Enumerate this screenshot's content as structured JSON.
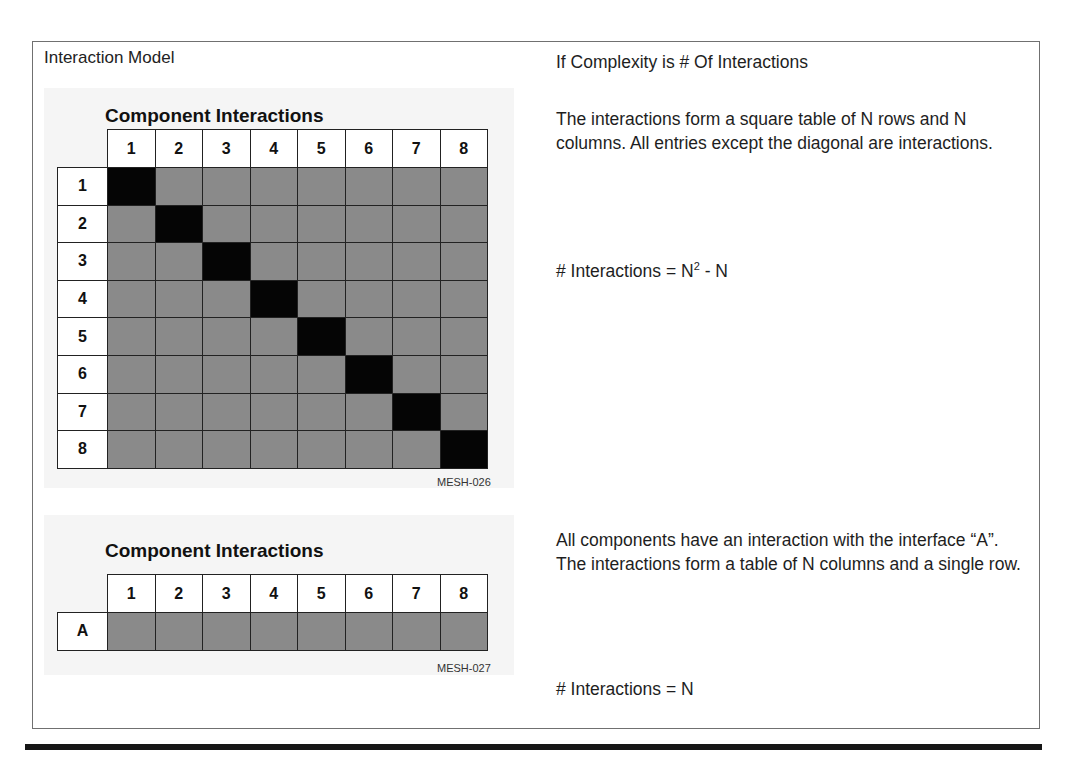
{
  "left_panel": {
    "title": "Interaction Model"
  },
  "figure_square": {
    "title": "Component Interactions",
    "id": "MESH-026",
    "column_headers": [
      "1",
      "2",
      "3",
      "4",
      "5",
      "6",
      "7",
      "8"
    ],
    "row_headers": [
      "1",
      "2",
      "3",
      "4",
      "5",
      "6",
      "7",
      "8"
    ],
    "cell_legend": {
      "gray": "interaction",
      "black": "diagonal (no interaction)"
    },
    "colors": {
      "interaction": "#8a8a8a",
      "diagonal": "#050505",
      "header": "#ffffff"
    }
  },
  "figure_row": {
    "title": "Component Interactions",
    "id": "MESH-027",
    "column_headers": [
      "1",
      "2",
      "3",
      "4",
      "5",
      "6",
      "7",
      "8"
    ],
    "row_headers": [
      "A"
    ]
  },
  "right_panel": {
    "heading": "If Complexity is # Of Interactions",
    "square_description": "The interactions form a square table of N rows and N columns.  All entries except the diagonal are interactions.",
    "square_formula_prefix": "# Interactions = N",
    "square_formula_exp": "2",
    "square_formula_suffix": " - N",
    "row_description": "All components have an interaction with the interface “A”.  The interactions form a table of N columns and a single row.",
    "row_formula": "# Interactions = N"
  }
}
